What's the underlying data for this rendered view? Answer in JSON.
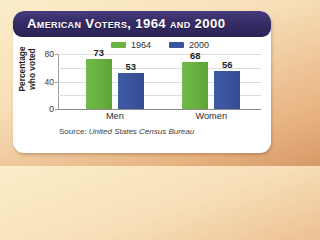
{
  "title": "American Voters, 1964 and 2000",
  "source_prefix": "Source:",
  "source_name": "United States Census Bureau",
  "colors": {
    "series_1964": "#69b442",
    "series_2000": "#39549c",
    "banner": "#352b66",
    "card": "#ffffff",
    "background": "#f2cfa1"
  },
  "legend": {
    "items": [
      {
        "label": "1964",
        "swatch": "legend-swatch-1964"
      },
      {
        "label": "2000",
        "swatch": "legend-swatch-2000"
      }
    ]
  },
  "chart_data": {
    "type": "bar",
    "title": "American Voters, 1964 and 2000",
    "xlabel": "",
    "ylabel": "Percentage who voted",
    "ylabel_line1": "Percentage",
    "ylabel_line2": "who voted",
    "categories": [
      "Men",
      "Women"
    ],
    "series": [
      {
        "name": "1964",
        "values": [
          73,
          68
        ],
        "color": "#69b442"
      },
      {
        "name": "2000",
        "values": [
          53,
          56
        ],
        "color": "#39549c"
      }
    ],
    "ylim": [
      0,
      80
    ],
    "yticks": [
      0,
      40,
      80
    ],
    "ytick_labels": [
      "0",
      "40",
      "80"
    ],
    "gridlines": [
      20,
      40,
      60,
      80
    ],
    "grid": true,
    "legend_position": "top-center",
    "source": "Source: United States Census Bureau"
  }
}
